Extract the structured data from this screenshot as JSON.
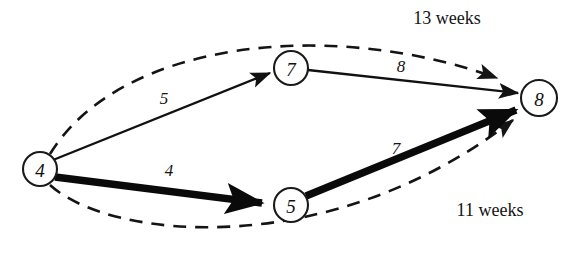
{
  "diagram": {
    "background_color": "#ffffff",
    "line_color": "#141414",
    "nodes": [
      {
        "id": "node-4",
        "label": "4",
        "cx": 40,
        "cy": 169,
        "r": 17
      },
      {
        "id": "node-7",
        "label": "7",
        "cx": 291,
        "cy": 68,
        "r": 17
      },
      {
        "id": "node-5",
        "label": "5",
        "cx": 291,
        "cy": 205,
        "r": 17
      },
      {
        "id": "node-8",
        "label": "8",
        "cx": 539,
        "cy": 98,
        "r": 18
      }
    ],
    "edges": [
      {
        "id": "edge-4-7",
        "from": "4",
        "to": "7",
        "weight": "5",
        "style": "thin",
        "label_x": 164,
        "label_y": 98
      },
      {
        "id": "edge-7-8",
        "from": "7",
        "to": "8",
        "weight": "8",
        "style": "thin",
        "label_x": 401,
        "label_y": 66
      },
      {
        "id": "edge-4-5",
        "from": "4",
        "to": "5",
        "weight": "4",
        "style": "thick",
        "label_x": 169,
        "label_y": 170
      },
      {
        "id": "edge-5-8",
        "from": "5",
        "to": "8",
        "weight": "7",
        "style": "thick",
        "label_x": 396,
        "label_y": 148
      }
    ],
    "arcs": [
      {
        "id": "arc-top",
        "label": "13 weeks",
        "style": "dashed",
        "label_x": 447,
        "label_y": 18
      },
      {
        "id": "arc-bottom",
        "label": "11 weeks",
        "style": "dashed",
        "label_x": 490,
        "label_y": 210
      }
    ]
  }
}
